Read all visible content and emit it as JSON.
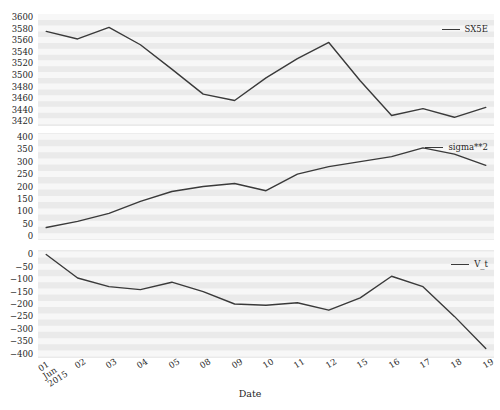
{
  "chart_data": [
    {
      "type": "line",
      "panel_index": 0,
      "title": "",
      "xlabel": "",
      "ylabel": "",
      "legend_position": "upper right",
      "grid": true,
      "categories": [
        "01",
        "02",
        "03",
        "04",
        "05",
        "08",
        "09",
        "10",
        "11",
        "12",
        "15",
        "16",
        "17",
        "18",
        "19"
      ],
      "yticks": [
        3600,
        3580,
        3560,
        3540,
        3520,
        3500,
        3480,
        3460,
        3440,
        3420
      ],
      "ylim": [
        3412,
        3605
      ],
      "series": [
        {
          "name": "SX5E",
          "color": "#3a3a3a",
          "values": [
            3575,
            3562,
            3582,
            3552,
            3510,
            3467,
            3456,
            3495,
            3528,
            3556,
            3490,
            3430,
            3442,
            3427,
            3444
          ]
        }
      ]
    },
    {
      "type": "line",
      "panel_index": 1,
      "title": "",
      "xlabel": "",
      "ylabel": "",
      "legend_position": "upper right",
      "grid": true,
      "categories": [
        "01",
        "02",
        "03",
        "04",
        "05",
        "08",
        "09",
        "10",
        "11",
        "12",
        "15",
        "16",
        "17",
        "18",
        "19"
      ],
      "yticks": [
        400,
        350,
        300,
        250,
        200,
        150,
        100,
        50,
        0
      ],
      "ylim": [
        -15,
        415
      ],
      "series": [
        {
          "name": "sigma**2",
          "color": "#3a3a3a",
          "values": [
            35,
            60,
            92,
            140,
            180,
            200,
            212,
            183,
            250,
            280,
            300,
            320,
            355,
            330,
            285
          ]
        }
      ]
    },
    {
      "type": "line",
      "panel_index": 2,
      "title": "",
      "xlabel": "Date",
      "ylabel": "",
      "legend_position": "upper right",
      "grid": true,
      "categories": [
        "01",
        "02",
        "03",
        "04",
        "05",
        "08",
        "09",
        "10",
        "11",
        "12",
        "15",
        "16",
        "17",
        "18",
        "19"
      ],
      "yticks": [
        0,
        -50,
        -100,
        -150,
        -200,
        -250,
        -300,
        -350,
        -400
      ],
      "ylim": [
        -418,
        18
      ],
      "series": [
        {
          "name": "V_t",
          "color": "#3a3a3a",
          "values": [
            0,
            -95,
            -130,
            -142,
            -112,
            -150,
            -200,
            -205,
            -195,
            -225,
            -175,
            -88,
            -130,
            -250,
            -380
          ]
        }
      ]
    }
  ],
  "xaxis": {
    "label": "Date",
    "ticks": [
      {
        "main": "01",
        "sub1": "Jun",
        "sub2": "2015"
      },
      {
        "main": "02",
        "sub1": "",
        "sub2": ""
      },
      {
        "main": "03",
        "sub1": "",
        "sub2": ""
      },
      {
        "main": "04",
        "sub1": "",
        "sub2": ""
      },
      {
        "main": "05",
        "sub1": "",
        "sub2": ""
      },
      {
        "main": "08",
        "sub1": "",
        "sub2": ""
      },
      {
        "main": "09",
        "sub1": "",
        "sub2": ""
      },
      {
        "main": "10",
        "sub1": "",
        "sub2": ""
      },
      {
        "main": "11",
        "sub1": "",
        "sub2": ""
      },
      {
        "main": "12",
        "sub1": "",
        "sub2": ""
      },
      {
        "main": "15",
        "sub1": "",
        "sub2": ""
      },
      {
        "main": "16",
        "sub1": "",
        "sub2": ""
      },
      {
        "main": "17",
        "sub1": "",
        "sub2": ""
      },
      {
        "main": "18",
        "sub1": "",
        "sub2": ""
      },
      {
        "main": "19",
        "sub1": "",
        "sub2": ""
      }
    ]
  },
  "style": {
    "plot_background": "#eaeaea",
    "grid_color": "#f7f7f7",
    "line_color": "#3a3a3a",
    "text_color": "#262626",
    "figure_background": "#ffffff"
  }
}
